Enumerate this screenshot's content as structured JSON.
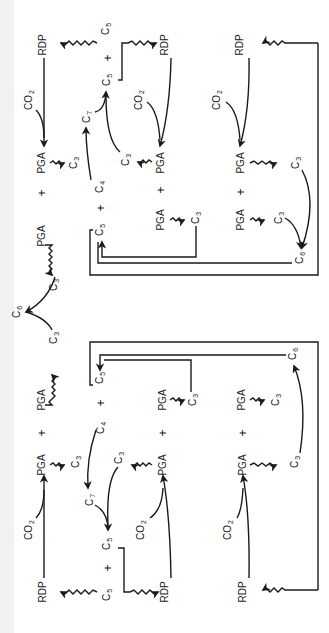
{
  "diagram": {
    "orientation": "rotated-90-ccw",
    "stroke_color": "#1a1a1a",
    "background": "#ffffff",
    "labels": [
      {
        "id": "l1",
        "text": "RDP",
        "sub": "",
        "x": 43,
        "y": 45
      },
      {
        "id": "l2",
        "text": "C",
        "sub": "5",
        "x": 107,
        "y": 29
      },
      {
        "id": "l3",
        "text": "+",
        "sub": "",
        "x": 108,
        "y": 58
      },
      {
        "id": "l4",
        "text": "C",
        "sub": "5",
        "x": 108,
        "y": 80
      },
      {
        "id": "l5",
        "text": "RDP",
        "sub": "",
        "x": 165,
        "y": 45
      },
      {
        "id": "l6",
        "text": "RDP",
        "sub": "",
        "x": 240,
        "y": 45
      },
      {
        "id": "l7",
        "text": "CO",
        "sub": "2",
        "x": 30,
        "y": 100
      },
      {
        "id": "l8",
        "text": "C",
        "sub": "7",
        "x": 88,
        "y": 117
      },
      {
        "id": "l9",
        "text": "CO",
        "sub": "2",
        "x": 140,
        "y": 100
      },
      {
        "id": "l10",
        "text": "CO",
        "sub": "2",
        "x": 218,
        "y": 100
      },
      {
        "id": "l11",
        "text": "PGA",
        "sub": "",
        "x": 42,
        "y": 163
      },
      {
        "id": "l12",
        "text": "C",
        "sub": "3",
        "x": 75,
        "y": 163
      },
      {
        "id": "l13",
        "text": "C",
        "sub": "3",
        "x": 127,
        "y": 160
      },
      {
        "id": "l14",
        "text": "PGA",
        "sub": "",
        "x": 161,
        "y": 163
      },
      {
        "id": "l15",
        "text": "PGA",
        "sub": "",
        "x": 241,
        "y": 163
      },
      {
        "id": "l16",
        "text": "C",
        "sub": "3",
        "x": 297,
        "y": 163
      },
      {
        "id": "l17",
        "text": "+",
        "sub": "",
        "x": 42,
        "y": 193
      },
      {
        "id": "l18",
        "text": "C",
        "sub": "4",
        "x": 101,
        "y": 187
      },
      {
        "id": "l19",
        "text": "+",
        "sub": "",
        "x": 161,
        "y": 190
      },
      {
        "id": "l20",
        "text": "+",
        "sub": "",
        "x": 241,
        "y": 192
      },
      {
        "id": "l21",
        "text": "+",
        "sub": "",
        "x": 101,
        "y": 208
      },
      {
        "id": "l22",
        "text": "PGA",
        "sub": "",
        "x": 42,
        "y": 236
      },
      {
        "id": "l23",
        "text": "PGA",
        "sub": "",
        "x": 161,
        "y": 220
      },
      {
        "id": "l24",
        "text": "C",
        "sub": "3",
        "x": 197,
        "y": 218
      },
      {
        "id": "l25",
        "text": "PGA",
        "sub": "",
        "x": 241,
        "y": 220
      },
      {
        "id": "l26",
        "text": "C",
        "sub": "3",
        "x": 280,
        "y": 218
      },
      {
        "id": "l27",
        "text": "C",
        "sub": "5",
        "x": 101,
        "y": 230
      },
      {
        "id": "l28",
        "text": "C",
        "sub": "6",
        "x": 301,
        "y": 258
      },
      {
        "id": "l29",
        "text": "C",
        "sub": "3",
        "x": 55,
        "y": 285
      },
      {
        "id": "l30",
        "text": "C",
        "sub": "6",
        "x": 18,
        "y": 312
      },
      {
        "id": "l31",
        "text": "C",
        "sub": "3",
        "x": 55,
        "y": 338
      },
      {
        "id": "l32",
        "text": "PGA",
        "sub": "",
        "x": 42,
        "y": 400
      },
      {
        "id": "l33",
        "text": "C",
        "sub": "5",
        "x": 101,
        "y": 378
      },
      {
        "id": "l34",
        "text": "+",
        "sub": "",
        "x": 101,
        "y": 403
      },
      {
        "id": "l35",
        "text": "PGA",
        "sub": "",
        "x": 163,
        "y": 400
      },
      {
        "id": "l36",
        "text": "C",
        "sub": "3",
        "x": 194,
        "y": 400
      },
      {
        "id": "l37",
        "text": "PGA",
        "sub": "",
        "x": 242,
        "y": 400
      },
      {
        "id": "l38",
        "text": "C",
        "sub": "3",
        "x": 277,
        "y": 400
      },
      {
        "id": "l39",
        "text": "C",
        "sub": "6",
        "x": 294,
        "y": 354
      },
      {
        "id": "l40",
        "text": "+",
        "sub": "",
        "x": 42,
        "y": 433
      },
      {
        "id": "l41",
        "text": "C",
        "sub": "4",
        "x": 102,
        "y": 428
      },
      {
        "id": "l42",
        "text": "+",
        "sub": "",
        "x": 163,
        "y": 433
      },
      {
        "id": "l43",
        "text": "+",
        "sub": "",
        "x": 243,
        "y": 433
      },
      {
        "id": "l44",
        "text": "PGA",
        "sub": "",
        "x": 42,
        "y": 465
      },
      {
        "id": "l45",
        "text": "C",
        "sub": "3",
        "x": 77,
        "y": 462
      },
      {
        "id": "l46",
        "text": "C",
        "sub": "3",
        "x": 120,
        "y": 458
      },
      {
        "id": "l47",
        "text": "PGA",
        "sub": "",
        "x": 163,
        "y": 465
      },
      {
        "id": "l48",
        "text": "PGA",
        "sub": "",
        "x": 243,
        "y": 465
      },
      {
        "id": "l49",
        "text": "C",
        "sub": "3",
        "x": 296,
        "y": 462
      },
      {
        "id": "l50",
        "text": "C",
        "sub": "7",
        "x": 91,
        "y": 500
      },
      {
        "id": "l51",
        "text": "CO",
        "sub": "2",
        "x": 30,
        "y": 530
      },
      {
        "id": "l52",
        "text": "CO",
        "sub": "2",
        "x": 142,
        "y": 530
      },
      {
        "id": "l53",
        "text": "CO",
        "sub": "2",
        "x": 229,
        "y": 530
      },
      {
        "id": "l54",
        "text": "C",
        "sub": "5",
        "x": 108,
        "y": 544
      },
      {
        "id": "l55",
        "text": "+",
        "sub": "",
        "x": 108,
        "y": 568
      },
      {
        "id": "l56",
        "text": "C",
        "sub": "5",
        "x": 108,
        "y": 595
      },
      {
        "id": "l57",
        "text": "RDP",
        "sub": "",
        "x": 43,
        "y": 592
      },
      {
        "id": "l58",
        "text": "RDP",
        "sub": "",
        "x": 165,
        "y": 592
      },
      {
        "id": "l59",
        "text": "RDP",
        "sub": "",
        "x": 243,
        "y": 592
      }
    ]
  }
}
